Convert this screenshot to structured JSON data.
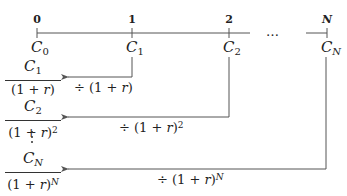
{
  "timeline": {
    "periods": [
      "0",
      "1",
      "2",
      "N"
    ],
    "ellipsis": "…",
    "cash_flows": [
      {
        "symbol": "C",
        "subscript": "0"
      },
      {
        "symbol": "C",
        "subscript": "1"
      },
      {
        "symbol": "C",
        "subscript": "2"
      },
      {
        "symbol": "C",
        "subscript": "N"
      }
    ]
  },
  "discounting": [
    {
      "numerator_symbol": "C",
      "numerator_sub": "1",
      "denominator": "(1 + ",
      "rate": "r",
      "denominator_close": ")",
      "exponent": "",
      "operator": "÷ (1 + ",
      "operator_close": ")"
    },
    {
      "numerator_symbol": "C",
      "numerator_sub": "2",
      "denominator": "(1 + ",
      "rate": "r",
      "denominator_close": ")",
      "exponent": "2",
      "operator": "÷ (1 + ",
      "operator_close": ")"
    },
    {
      "numerator_symbol": "C",
      "numerator_sub": "N",
      "denominator": "(1 + ",
      "rate": "r",
      "denominator_close": ")",
      "exponent": "N",
      "operator": "÷ (1 + ",
      "operator_close": ")"
    }
  ],
  "colors": {
    "line": "#555555",
    "text": "#222222"
  }
}
